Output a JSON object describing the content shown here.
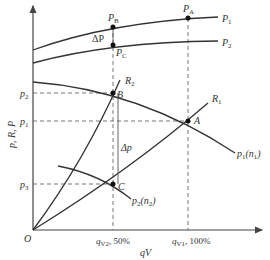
{
  "diagram": {
    "y_axis_label": "p, R, P",
    "x_axis_label": "qV",
    "origin_label": "O",
    "x_ticks": [
      {
        "main": "q",
        "sub": "V2",
        "suffix": ", 50%"
      },
      {
        "main": "q",
        "sub": "V1",
        "suffix": ", 100%"
      }
    ],
    "y_ticks": [
      {
        "main": "p",
        "sub": "2"
      },
      {
        "main": "p",
        "sub": "1"
      },
      {
        "main": "p",
        "sub": "3"
      }
    ],
    "power_curves": [
      {
        "main": "P",
        "sub": "1"
      },
      {
        "main": "P",
        "sub": "2"
      }
    ],
    "power_points": [
      {
        "main": "P",
        "sub": "A"
      },
      {
        "main": "P",
        "sub": "B"
      },
      {
        "main": "P",
        "sub": "C"
      }
    ],
    "delta_P": "ΔP",
    "delta_p": "Δp",
    "resistance_curves": [
      {
        "main": "R",
        "sub": "1"
      },
      {
        "main": "R",
        "sub": "2"
      }
    ],
    "pump_curves": [
      {
        "main": "p",
        "sub": "1",
        "suffix": "(n",
        "sub2": "1",
        "end": ")"
      },
      {
        "main": "p",
        "sub": "2",
        "suffix": "(n",
        "sub2": "2",
        "end": ")"
      }
    ],
    "points": [
      "A",
      "B",
      "C"
    ]
  }
}
